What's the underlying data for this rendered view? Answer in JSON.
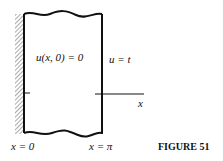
{
  "figure": {
    "caption": "FIGURE 51",
    "labels": {
      "initial_condition": "u(x, 0) = 0",
      "right_boundary": "u = t",
      "axis_x": "x",
      "left_bottom": "x = 0",
      "right_bottom": "x = π"
    },
    "colors": {
      "ink": "#111111",
      "background": "#ffffff"
    }
  }
}
